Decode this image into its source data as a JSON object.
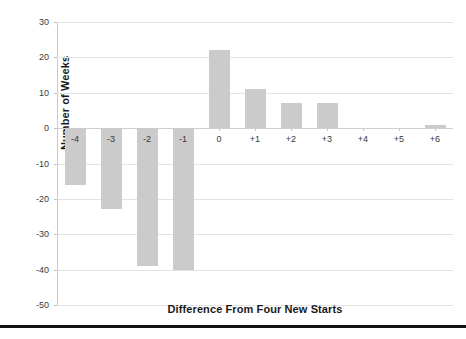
{
  "chart_data": {
    "type": "bar",
    "title": "",
    "xlabel": "Difference From Four New Starts",
    "ylabel": "Number of Weeks",
    "categories": [
      "-4",
      "-3",
      "-2",
      "-1",
      "0",
      "+1",
      "+2",
      "+3",
      "+4",
      "+5",
      "+6"
    ],
    "values": [
      -16,
      -23,
      -39,
      -40,
      22,
      11,
      7,
      7,
      0,
      0,
      1
    ],
    "ylim": [
      -50,
      30
    ],
    "ytick_labels": [
      "30",
      "20",
      "10",
      "0",
      "-10",
      "-20",
      "-30",
      "-40",
      "-50"
    ],
    "ytick_values": [
      30,
      20,
      10,
      0,
      -10,
      -20,
      -30,
      -40,
      -50
    ],
    "grid": true,
    "legend": "none",
    "bar_color": "#cbcbcb",
    "background_color": "#ffffff",
    "gridline_color": "#e3e3e3",
    "axis_color": "#c9c9c9"
  },
  "footer": {
    "caption": ""
  }
}
